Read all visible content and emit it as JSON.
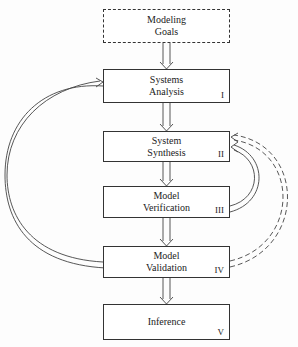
{
  "diagram": {
    "nodes": [
      {
        "id": "goals",
        "label": "Modeling\nGoals",
        "number": "",
        "style": "dashed"
      },
      {
        "id": "analysis",
        "label": "Systems\nAnalysis",
        "number": "I",
        "style": "solid"
      },
      {
        "id": "synthesis",
        "label": "System\nSynthesis",
        "number": "II",
        "style": "solid"
      },
      {
        "id": "verification",
        "label": "Model\nVerification",
        "number": "III",
        "style": "solid"
      },
      {
        "id": "validation",
        "label": "Model\nValidation",
        "number": "IV",
        "style": "solid"
      },
      {
        "id": "inference",
        "label": "Inference",
        "number": "V",
        "style": "solid"
      }
    ],
    "edges": [
      {
        "from": "goals",
        "to": "analysis",
        "style": "double-solid"
      },
      {
        "from": "analysis",
        "to": "synthesis",
        "style": "double-solid"
      },
      {
        "from": "synthesis",
        "to": "verification",
        "style": "double-solid"
      },
      {
        "from": "verification",
        "to": "validation",
        "style": "double-solid"
      },
      {
        "from": "validation",
        "to": "inference",
        "style": "double-solid"
      },
      {
        "from": "validation",
        "to": "analysis",
        "style": "double-solid-curved-left"
      },
      {
        "from": "verification",
        "to": "synthesis",
        "style": "double-solid-curved-right"
      },
      {
        "from": "validation",
        "to": "synthesis",
        "style": "double-dashed-curved-right"
      }
    ]
  }
}
